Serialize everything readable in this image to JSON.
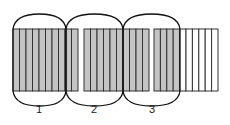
{
  "diagram": {
    "title": "",
    "colors": {
      "shaded_fill": "#c4c4c4",
      "unshaded_fill": "#ffffff",
      "line": "#333333",
      "oval_stroke": "#111111"
    },
    "bar_top": 29,
    "bar_bottom": 91,
    "blocks": [
      {
        "x": 13,
        "columns": 10,
        "col_width": 6.5,
        "shaded_columns": 10
      },
      {
        "x": 84,
        "columns": 10,
        "col_width": 6.5,
        "shaded_columns": 10
      },
      {
        "x": 154,
        "columns": 10,
        "col_width": 6.4,
        "shaded_columns": 4
      }
    ],
    "groups": [
      {
        "label": "1",
        "x_start": 13,
        "x_end": 66,
        "label_x": 39,
        "label_y": 110
      },
      {
        "label": "2",
        "x_start": 66,
        "x_end": 123,
        "label_x": 94,
        "label_y": 110
      },
      {
        "label": "3",
        "x_start": 123,
        "x_end": 180,
        "label_x": 152,
        "label_y": 110
      }
    ],
    "oval_top": 14,
    "oval_bottom": 106
  }
}
